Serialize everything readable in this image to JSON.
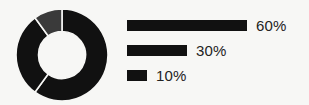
{
  "figure": {
    "background_color": "#f7f7f5",
    "ink_color": "#111111",
    "text_color": "#232323"
  },
  "donut": {
    "name": "donut-chart",
    "outer_diameter_px": 92,
    "inner_diameter_px": 47,
    "start_angle_deg": 0,
    "gap_color": "#f7f7f5",
    "gap_width_px": 1.6
  },
  "legend": {
    "bar_track_px": 120,
    "bar_height_px": 11,
    "items": [
      {
        "label": "60%",
        "value": 60,
        "color": "#111111"
      },
      {
        "label": "30%",
        "value": 30,
        "color": "#111111"
      },
      {
        "label": "10%",
        "value": 10,
        "color": "#111111"
      }
    ]
  },
  "chart_data": {
    "type": "pie",
    "title": "",
    "subtitle": "",
    "xlabel": "",
    "ylabel": "",
    "categories": [
      "60%",
      "30%",
      "10%"
    ],
    "values": [
      60,
      30,
      10
    ],
    "data_labels": [
      "60%",
      "30%",
      "10%"
    ],
    "units": "percent",
    "total": 100,
    "donut": true,
    "inner_radius_ratio": 0.51,
    "start_angle_deg": 0,
    "direction": "clockwise",
    "colors": [
      "#111111",
      "#111111",
      "#3a3a3a"
    ],
    "legend": {
      "position": "right",
      "style": "horizontal-bars",
      "entries": [
        "60%",
        "30%",
        "10%"
      ]
    },
    "grid": false,
    "axis_visible": false,
    "companion_chart": {
      "type": "bar",
      "orientation": "horizontal",
      "categories": [
        "60%",
        "30%",
        "10%"
      ],
      "values": [
        60,
        30,
        10
      ],
      "xlim": [
        0,
        60
      ],
      "bar_lengths_px": [
        120,
        60,
        20
      ]
    }
  }
}
